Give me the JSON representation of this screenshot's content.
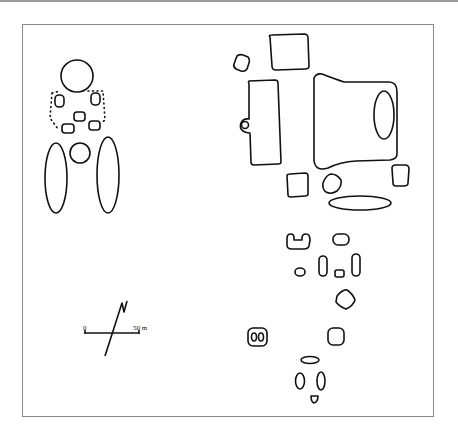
{
  "figure": {
    "type": "site-plan",
    "border_color": "#8a8a8a",
    "stroke_color": "#111111"
  },
  "scale_bar": {
    "start_label": "0",
    "end_label": "50 m",
    "north_symbol": "N"
  },
  "groups": {
    "west_group": {
      "features": [
        "large-circle",
        "enclosure-dotted",
        "small-oval-left",
        "small-oval-right",
        "small-square-1",
        "small-square-2",
        "small-square-3",
        "medium-circle",
        "long-oval-left",
        "long-oval-right"
      ]
    },
    "east_group": {
      "features": [
        "square-top",
        "small-square-nw",
        "rectangle-with-annex",
        "large-plaza-with-oval",
        "square-mid-left",
        "rounded-diamond",
        "square-mid-right",
        "long-oval-horizontal",
        "u-shaped",
        "small-oval",
        "small-rounded",
        "vertical-oval-a",
        "tiny-square",
        "vertical-oval-b",
        "rotated-square",
        "double-oval-enclosure",
        "square-lower",
        "flat-oval",
        "vertical-oval-c",
        "vertical-oval-d",
        "tiny-shield"
      ]
    }
  }
}
